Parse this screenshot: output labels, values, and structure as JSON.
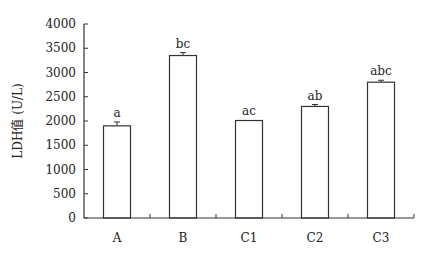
{
  "chart_data": {
    "type": "bar",
    "title": "",
    "xlabel": "",
    "ylabel": "LDH值 (U/L)",
    "ylim": [
      0,
      4000
    ],
    "yticks": [
      0,
      500,
      1000,
      1500,
      2000,
      2500,
      3000,
      3500,
      4000
    ],
    "ytick_labels": [
      "0",
      "500",
      "1000",
      "1500",
      "2000",
      "2500",
      "3000",
      "3500",
      "4000"
    ],
    "categories": [
      "A",
      "B",
      "C1",
      "C2",
      "C3"
    ],
    "values": [
      1900,
      3350,
      2010,
      2300,
      2800
    ],
    "errors": [
      80,
      60,
      0,
      40,
      40
    ],
    "annotations": [
      "a",
      "bc",
      "ac",
      "ab",
      "abc"
    ],
    "grid": false,
    "legend": null,
    "bar_fill": "#ffffff",
    "bar_stroke": "#333333"
  }
}
